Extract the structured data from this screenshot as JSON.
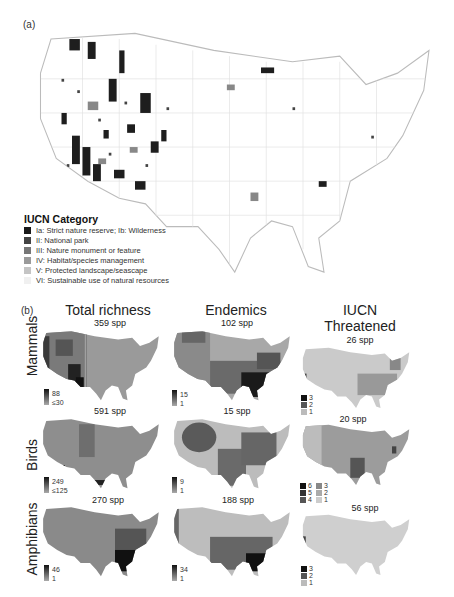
{
  "panel_a": {
    "label": "(a)",
    "legend": {
      "title": "IUCN Category",
      "items": [
        {
          "label": "Ia: Strict nature reserve; Ib: Wilderness",
          "color": "#1a1a1a"
        },
        {
          "label": "II: National park",
          "color": "#444444"
        },
        {
          "label": "III: Nature monument or feature",
          "color": "#777777"
        },
        {
          "label": "IV: Habitat/species management",
          "color": "#9a9a9a"
        },
        {
          "label": "V: Protected landscape/seascape",
          "color": "#c4c4c4"
        },
        {
          "label": "VI: Sustainable use of natural resources",
          "color": "#f0f0f0"
        }
      ]
    }
  },
  "panel_b": {
    "label": "(b)",
    "columns": [
      "Total richness",
      "Endemics",
      "IUCN Threatened"
    ],
    "column_lines": [
      [
        "Total richness"
      ],
      [
        "Endemics"
      ],
      [
        "IUCN",
        "Threatened"
      ]
    ],
    "rows": [
      {
        "name": "Mammals",
        "cells": [
          {
            "spp": "359 spp",
            "scale_max": "88",
            "scale_min": "≤30"
          },
          {
            "spp": "102 spp",
            "scale_max": "15",
            "scale_min": "1"
          },
          {
            "spp": "26 spp",
            "discrete": [
              "3",
              "2",
              "1"
            ]
          }
        ]
      },
      {
        "name": "Birds",
        "cells": [
          {
            "spp": "591 spp",
            "scale_max": "249",
            "scale_min": "≤125"
          },
          {
            "spp": "15 spp",
            "scale_max": "9",
            "scale_min": "1"
          },
          {
            "spp": "20 spp",
            "discrete": [
              "6",
              "5",
              "4",
              "3",
              "2",
              "1"
            ]
          }
        ]
      },
      {
        "name": "Amphibians",
        "cells": [
          {
            "spp": "270 spp",
            "scale_max": "46",
            "scale_min": "1"
          },
          {
            "spp": "188 spp",
            "scale_max": "34",
            "scale_min": "1"
          },
          {
            "spp": "56 spp",
            "discrete": [
              "3",
              "2",
              "1"
            ]
          }
        ]
      }
    ]
  }
}
